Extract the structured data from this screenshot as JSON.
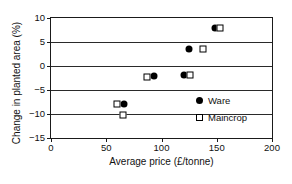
{
  "chart_data": {
    "type": "scatter",
    "title": "",
    "xlabel": "Average price (£/tonne)",
    "ylabel": "Change in planted area (%)",
    "xlim": [
      0,
      200
    ],
    "ylim": [
      -15,
      10
    ],
    "xticks": [
      0,
      50,
      100,
      150,
      200
    ],
    "yticks": [
      10,
      5,
      0,
      -5,
      -10,
      -15
    ],
    "xticklabels": [
      "0",
      "50",
      "100",
      "150",
      "200"
    ],
    "yticklabels": [
      "10",
      "5",
      "0",
      "−5",
      "−10",
      "−15"
    ],
    "grid": "horizontal",
    "legend_position": "inside-lower-right",
    "series": [
      {
        "name": "Ware",
        "marker": "filled-circle",
        "color": "#000000",
        "points": [
          {
            "x": 66,
            "y": -8.0
          },
          {
            "x": 93,
            "y": -2.1
          },
          {
            "x": 120,
            "y": -1.8
          },
          {
            "x": 125,
            "y": 3.5
          },
          {
            "x": 148,
            "y": 8.0
          }
        ]
      },
      {
        "name": "Maincrop",
        "marker": "open-square",
        "color": "#000000",
        "points": [
          {
            "x": 60,
            "y": -8.0
          },
          {
            "x": 65,
            "y": -10.3
          },
          {
            "x": 87,
            "y": -2.3
          },
          {
            "x": 126,
            "y": -1.8
          },
          {
            "x": 138,
            "y": 3.5
          },
          {
            "x": 153,
            "y": 8.0
          }
        ]
      }
    ]
  },
  "legend": {
    "items": [
      {
        "label": "Ware",
        "marker": "filled-circle"
      },
      {
        "label": "Maincrop",
        "marker": "open-square"
      }
    ]
  }
}
